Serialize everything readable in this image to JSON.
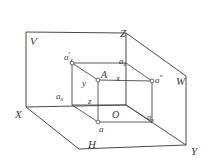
{
  "figure": {
    "stroke_color": "#4a4a4a",
    "label_color": "#3a3a3a",
    "background": "#ffffff",
    "width": 206,
    "height": 167
  },
  "planes": [
    {
      "key": "V",
      "label": "V",
      "name": "vertical-projection-plane",
      "x": 30,
      "y": 36
    },
    {
      "key": "H",
      "label": "H",
      "name": "horizontal-projection-plane",
      "x": 88,
      "y": 139
    },
    {
      "key": "W",
      "label": "W",
      "name": "profile-projection-plane",
      "x": 176,
      "y": 76
    }
  ],
  "axes": [
    {
      "key": "X",
      "label": "X",
      "name": "axis-x",
      "x": 15,
      "y": 109
    },
    {
      "key": "Y",
      "label": "Y",
      "name": "axis-y",
      "x": 191,
      "y": 146
    },
    {
      "key": "Z",
      "label": "Z",
      "name": "axis-z",
      "x": 120,
      "y": 28
    }
  ],
  "points": [
    {
      "key": "A",
      "label": "A",
      "name": "point-a",
      "x": 101,
      "y": 75
    },
    {
      "key": "O",
      "label": "O",
      "name": "origin-o",
      "x": 112,
      "y": 110
    },
    {
      "key": "a",
      "label": "a",
      "name": "horizontal-projection-a",
      "x": 99,
      "y": 124
    },
    {
      "key": "a1",
      "label": "a",
      "sup": "'",
      "name": "vertical-projection-a-prime",
      "x": 67,
      "y": 57
    },
    {
      "key": "a2",
      "label": "a",
      "sup": "″",
      "name": "profile-projection-a-double-prime",
      "x": 149,
      "y": 79
    }
  ],
  "foot_labels": [
    {
      "key": "ax_left",
      "base": "a",
      "sub": "x",
      "name": "label-a-x",
      "x": 58,
      "y": 94
    },
    {
      "key": "ax_top",
      "base": "a",
      "sub": "x",
      "sup": "'",
      "name": "label-a-x-prime",
      "x": 66,
      "y": 57
    },
    {
      "key": "az",
      "base": "a",
      "sub": "z",
      "name": "label-a-z",
      "x": 120,
      "y": 61
    },
    {
      "key": "ay",
      "base": "a",
      "sub": "y",
      "name": "label-a-y",
      "x": 148,
      "y": 116
    }
  ],
  "coord_labels": [
    {
      "key": "x",
      "label": "x",
      "name": "coordinate-x",
      "x": 116,
      "y": 79
    },
    {
      "key": "y",
      "label": "y",
      "name": "coordinate-y",
      "x": 83,
      "y": 82
    },
    {
      "key": "z",
      "label": "z",
      "name": "coordinate-z",
      "x": 89,
      "y": 100
    }
  ],
  "geometry": {
    "outer_description": "three mutually perpendicular projection planes drawn in oblique view",
    "inner_description": "coordinate box from origin O to point A with projections"
  }
}
